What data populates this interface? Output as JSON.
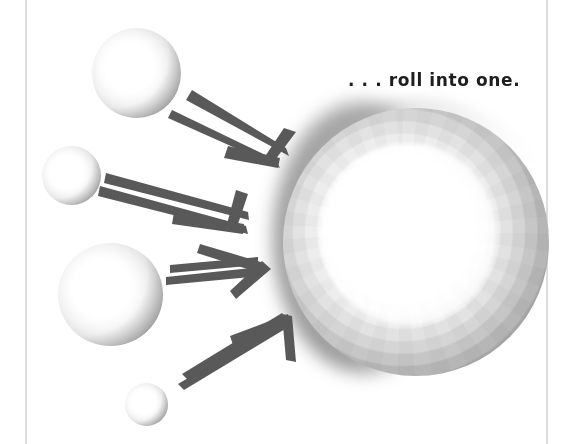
{
  "canvas": {
    "width": 581,
    "height": 444,
    "background_color": "#ffffff"
  },
  "caption": {
    "text": ". . . roll into one.",
    "color": "#1e1e1e"
  },
  "guides": {
    "color": "#c4c4c4",
    "left_label": "left-margin-rule",
    "right_label": "right-margin-rule"
  },
  "palette": {
    "arrow_color": "#595959",
    "sphere_highlight": "#ffffff",
    "sphere_edge": "#757575",
    "halo_color": "#2d2d2d"
  },
  "spheres": [
    {
      "id": "sphere-1",
      "label": "small-sphere-top",
      "x": 92,
      "y": 28,
      "diameter": 89
    },
    {
      "id": "sphere-2",
      "label": "small-sphere-upper-left",
      "x": 42,
      "y": 146,
      "diameter": 59
    },
    {
      "id": "sphere-3",
      "label": "small-sphere-lower-left",
      "x": 58,
      "y": 243,
      "diameter": 105
    },
    {
      "id": "sphere-4",
      "label": "small-sphere-bottom",
      "x": 125,
      "y": 383,
      "diameter": 43
    }
  ],
  "big_sphere": {
    "label": "merged-sphere",
    "x": 283,
    "y": 108,
    "diameter": 266
  },
  "arrows": [
    {
      "id": "arrow-1",
      "label": "arrow-from-top-sphere",
      "direction": "down-right"
    },
    {
      "id": "arrow-2",
      "label": "arrow-from-upper-left-sphere",
      "direction": "down-right"
    },
    {
      "id": "arrow-3",
      "label": "arrow-from-lower-left-sphere",
      "direction": "right"
    },
    {
      "id": "arrow-4",
      "label": "arrow-from-bottom-sphere",
      "direction": "up-right"
    }
  ]
}
